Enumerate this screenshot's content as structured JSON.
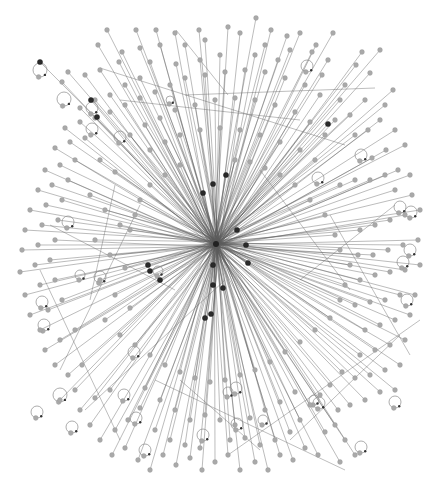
{
  "graph": {
    "type": "network",
    "layout": "radial-star",
    "width": 438,
    "height": 481,
    "colors": {
      "background": "#ffffff",
      "node": "#a9a9a9",
      "node_dark": "#2a2a2a",
      "edge": "#5a5a5a",
      "loop": "#8a8a8a"
    },
    "hub": {
      "x": 216,
      "y": 244,
      "r": 3
    },
    "node_radius": 2.4,
    "nodes": [
      [
        107,
        30
      ],
      [
        136,
        30
      ],
      [
        256,
        18
      ],
      [
        333,
        33
      ],
      [
        176,
        64
      ],
      [
        228,
        27
      ],
      [
        300,
        33
      ],
      [
        199,
        30
      ],
      [
        175,
        33
      ],
      [
        156,
        30
      ],
      [
        240,
        33
      ],
      [
        271,
        30
      ],
      [
        287,
        36
      ],
      [
        316,
        45
      ],
      [
        328,
        60
      ],
      [
        362,
        52
      ],
      [
        312,
        52
      ],
      [
        278,
        60
      ],
      [
        255,
        55
      ],
      [
        205,
        40
      ],
      [
        185,
        45
      ],
      [
        160,
        45
      ],
      [
        140,
        48
      ],
      [
        119,
        62
      ],
      [
        98,
        45
      ],
      [
        122,
        52
      ],
      [
        85,
        75
      ],
      [
        68,
        72
      ],
      [
        62,
        82
      ],
      [
        100,
        70
      ],
      [
        150,
        62
      ],
      [
        200,
        60
      ],
      [
        220,
        55
      ],
      [
        265,
        45
      ],
      [
        290,
        50
      ],
      [
        345,
        85
      ],
      [
        322,
        75
      ],
      [
        340,
        100
      ],
      [
        356,
        65
      ],
      [
        380,
        50
      ],
      [
        370,
        73
      ],
      [
        365,
        100
      ],
      [
        350,
        115
      ],
      [
        335,
        120
      ],
      [
        393,
        90
      ],
      [
        385,
        105
      ],
      [
        380,
        120
      ],
      [
        368,
        130
      ],
      [
        355,
        135
      ],
      [
        395,
        130
      ],
      [
        405,
        145
      ],
      [
        386,
        150
      ],
      [
        372,
        158
      ],
      [
        410,
        175
      ],
      [
        398,
        170
      ],
      [
        385,
        175
      ],
      [
        370,
        180
      ],
      [
        355,
        180
      ],
      [
        340,
        185
      ],
      [
        395,
        190
      ],
      [
        412,
        195
      ],
      [
        420,
        210
      ],
      [
        405,
        215
      ],
      [
        390,
        220
      ],
      [
        375,
        225
      ],
      [
        360,
        230
      ],
      [
        418,
        240
      ],
      [
        403,
        245
      ],
      [
        388,
        250
      ],
      [
        373,
        255
      ],
      [
        358,
        255
      ],
      [
        420,
        265
      ],
      [
        405,
        270
      ],
      [
        390,
        272
      ],
      [
        375,
        275
      ],
      [
        360,
        280
      ],
      [
        415,
        295
      ],
      [
        400,
        295
      ],
      [
        385,
        300
      ],
      [
        370,
        302
      ],
      [
        355,
        305
      ],
      [
        410,
        315
      ],
      [
        395,
        320
      ],
      [
        380,
        325
      ],
      [
        365,
        330
      ],
      [
        405,
        340
      ],
      [
        390,
        345
      ],
      [
        375,
        350
      ],
      [
        360,
        355
      ],
      [
        400,
        365
      ],
      [
        385,
        370
      ],
      [
        370,
        375
      ],
      [
        355,
        378
      ],
      [
        395,
        390
      ],
      [
        380,
        392
      ],
      [
        365,
        400
      ],
      [
        350,
        405
      ],
      [
        342,
        372
      ],
      [
        330,
        385
      ],
      [
        320,
        395
      ],
      [
        310,
        405
      ],
      [
        300,
        420
      ],
      [
        338,
        410
      ],
      [
        335,
        425
      ],
      [
        325,
        432
      ],
      [
        345,
        440
      ],
      [
        355,
        455
      ],
      [
        340,
        462
      ],
      [
        318,
        455
      ],
      [
        305,
        448
      ],
      [
        293,
        460
      ],
      [
        280,
        455
      ],
      [
        268,
        470
      ],
      [
        255,
        462
      ],
      [
        240,
        470
      ],
      [
        228,
        455
      ],
      [
        215,
        462
      ],
      [
        202,
        470
      ],
      [
        190,
        458
      ],
      [
        176,
        465
      ],
      [
        163,
        455
      ],
      [
        150,
        470
      ],
      [
        138,
        460
      ],
      [
        125,
        448
      ],
      [
        112,
        455
      ],
      [
        100,
        440
      ],
      [
        115,
        430
      ],
      [
        128,
        420
      ],
      [
        140,
        408
      ],
      [
        90,
        425
      ],
      [
        80,
        410
      ],
      [
        95,
        398
      ],
      [
        110,
        390
      ],
      [
        75,
        390
      ],
      [
        60,
        400
      ],
      [
        68,
        375
      ],
      [
        82,
        365
      ],
      [
        55,
        365
      ],
      [
        45,
        350
      ],
      [
        60,
        340
      ],
      [
        75,
        330
      ],
      [
        40,
        330
      ],
      [
        30,
        315
      ],
      [
        48,
        310
      ],
      [
        62,
        300
      ],
      [
        25,
        295
      ],
      [
        40,
        285
      ],
      [
        55,
        280
      ],
      [
        20,
        272
      ],
      [
        35,
        265
      ],
      [
        50,
        260
      ],
      [
        22,
        250
      ],
      [
        38,
        245
      ],
      [
        55,
        240
      ],
      [
        25,
        230
      ],
      [
        42,
        225
      ],
      [
        58,
        220
      ],
      [
        30,
        210
      ],
      [
        46,
        205
      ],
      [
        62,
        200
      ],
      [
        38,
        190
      ],
      [
        52,
        185
      ],
      [
        68,
        180
      ],
      [
        45,
        170
      ],
      [
        60,
        165
      ],
      [
        75,
        160
      ],
      [
        55,
        148
      ],
      [
        70,
        142
      ],
      [
        85,
        138
      ],
      [
        65,
        128
      ],
      [
        80,
        122
      ],
      [
        95,
        118
      ],
      [
        80,
        108
      ],
      [
        95,
        100
      ],
      [
        110,
        95
      ],
      [
        125,
        85
      ],
      [
        140,
        78
      ],
      [
        110,
        112
      ],
      [
        125,
        105
      ],
      [
        140,
        98
      ],
      [
        155,
        92
      ],
      [
        170,
        85
      ],
      [
        185,
        78
      ],
      [
        205,
        75
      ],
      [
        225,
        72
      ],
      [
        245,
        70
      ],
      [
        265,
        72
      ],
      [
        285,
        78
      ],
      [
        305,
        85
      ],
      [
        320,
        95
      ],
      [
        130,
        135
      ],
      [
        145,
        125
      ],
      [
        160,
        118
      ],
      [
        175,
        110
      ],
      [
        195,
        105
      ],
      [
        215,
        100
      ],
      [
        235,
        98
      ],
      [
        255,
        100
      ],
      [
        275,
        105
      ],
      [
        295,
        112
      ],
      [
        310,
        122
      ],
      [
        325,
        135
      ],
      [
        150,
        150
      ],
      [
        165,
        142
      ],
      [
        180,
        135
      ],
      [
        200,
        130
      ],
      [
        220,
        128
      ],
      [
        240,
        130
      ],
      [
        260,
        135
      ],
      [
        280,
        142
      ],
      [
        300,
        150
      ],
      [
        315,
        160
      ],
      [
        100,
        160
      ],
      [
        115,
        172
      ],
      [
        90,
        195
      ],
      [
        105,
        210
      ],
      [
        120,
        225
      ],
      [
        95,
        240
      ],
      [
        110,
        255
      ],
      [
        125,
        268
      ],
      [
        100,
        280
      ],
      [
        115,
        295
      ],
      [
        130,
        308
      ],
      [
        105,
        320
      ],
      [
        120,
        335
      ],
      [
        135,
        345
      ],
      [
        150,
        355
      ],
      [
        165,
        365
      ],
      [
        180,
        372
      ],
      [
        195,
        378
      ],
      [
        210,
        382
      ],
      [
        225,
        380
      ],
      [
        240,
        375
      ],
      [
        255,
        370
      ],
      [
        270,
        362
      ],
      [
        285,
        352
      ],
      [
        300,
        342
      ],
      [
        315,
        330
      ],
      [
        330,
        318
      ],
      [
        340,
        300
      ],
      [
        345,
        285
      ],
      [
        350,
        265
      ],
      [
        340,
        250
      ],
      [
        335,
        235
      ],
      [
        325,
        215
      ],
      [
        310,
        200
      ],
      [
        295,
        185
      ],
      [
        280,
        175
      ],
      [
        265,
        168
      ],
      [
        250,
        162
      ],
      [
        235,
        160
      ],
      [
        180,
        165
      ],
      [
        165,
        175
      ],
      [
        150,
        185
      ],
      [
        140,
        200
      ],
      [
        135,
        215
      ],
      [
        130,
        230
      ],
      [
        160,
        400
      ],
      [
        175,
        410
      ],
      [
        190,
        420
      ],
      [
        205,
        415
      ],
      [
        220,
        420
      ],
      [
        235,
        425
      ],
      [
        250,
        418
      ],
      [
        265,
        410
      ],
      [
        280,
        402
      ],
      [
        295,
        392
      ],
      [
        145,
        388
      ],
      [
        170,
        440
      ],
      [
        185,
        445
      ],
      [
        200,
        448
      ],
      [
        230,
        440
      ],
      [
        245,
        438
      ],
      [
        260,
        445
      ],
      [
        275,
        440
      ],
      [
        290,
        432
      ],
      [
        155,
        430
      ]
    ],
    "dark_nodes": [
      [
        40,
        62
      ],
      [
        91,
        100
      ],
      [
        328,
        124
      ],
      [
        213,
        184
      ],
      [
        226,
        175
      ],
      [
        203,
        193
      ],
      [
        237,
        230
      ],
      [
        246,
        245
      ],
      [
        248,
        263
      ],
      [
        213,
        265
      ],
      [
        213,
        285
      ],
      [
        223,
        288
      ],
      [
        148,
        265
      ],
      [
        150,
        271
      ],
      [
        205,
        318
      ],
      [
        211,
        314
      ],
      [
        97,
        117
      ],
      [
        160,
        280
      ]
    ],
    "self_loops": [
      {
        "cx": 40,
        "cy": 70,
        "r": 7
      },
      {
        "cx": 64,
        "cy": 99,
        "r": 7
      },
      {
        "cx": 92,
        "cy": 108,
        "r": 6
      },
      {
        "cx": 92,
        "cy": 129,
        "r": 6
      },
      {
        "cx": 307,
        "cy": 66,
        "r": 6
      },
      {
        "cx": 120,
        "cy": 137,
        "r": 6
      },
      {
        "cx": 68,
        "cy": 222,
        "r": 6
      },
      {
        "cx": 100,
        "cy": 277,
        "r": 6
      },
      {
        "cx": 42,
        "cy": 302,
        "r": 6
      },
      {
        "cx": 44,
        "cy": 325,
        "r": 6
      },
      {
        "cx": 80,
        "cy": 275,
        "r": 5
      },
      {
        "cx": 134,
        "cy": 352,
        "r": 6
      },
      {
        "cx": 60,
        "cy": 395,
        "r": 7
      },
      {
        "cx": 37,
        "cy": 412,
        "r": 6
      },
      {
        "cx": 72,
        "cy": 427,
        "r": 6
      },
      {
        "cx": 124,
        "cy": 395,
        "r": 6
      },
      {
        "cx": 136,
        "cy": 418,
        "r": 6
      },
      {
        "cx": 145,
        "cy": 450,
        "r": 6
      },
      {
        "cx": 203,
        "cy": 435,
        "r": 6
      },
      {
        "cx": 236,
        "cy": 388,
        "r": 6
      },
      {
        "cx": 228,
        "cy": 392,
        "r": 5
      },
      {
        "cx": 237,
        "cy": 424,
        "r": 6
      },
      {
        "cx": 263,
        "cy": 420,
        "r": 5
      },
      {
        "cx": 314,
        "cy": 400,
        "r": 5
      },
      {
        "cx": 319,
        "cy": 403,
        "r": 6
      },
      {
        "cx": 395,
        "cy": 402,
        "r": 6
      },
      {
        "cx": 361,
        "cy": 447,
        "r": 6
      },
      {
        "cx": 361,
        "cy": 155,
        "r": 6
      },
      {
        "cx": 318,
        "cy": 178,
        "r": 6
      },
      {
        "cx": 400,
        "cy": 207,
        "r": 6
      },
      {
        "cx": 411,
        "cy": 212,
        "r": 6
      },
      {
        "cx": 410,
        "cy": 250,
        "r": 6
      },
      {
        "cx": 403,
        "cy": 262,
        "r": 6
      },
      {
        "cx": 407,
        "cy": 300,
        "r": 6
      },
      {
        "cx": 158,
        "cy": 271,
        "r": 5
      },
      {
        "cx": 170,
        "cy": 100,
        "r": 4
      }
    ],
    "cross_edges": [
      [
        [
          100,
          68
        ],
        [
          345,
          145
        ]
      ],
      [
        [
          176,
          30
        ],
        [
          228,
          95
        ]
      ],
      [
        [
          120,
          100
        ],
        [
          300,
          120
        ]
      ],
      [
        [
          185,
          95
        ],
        [
          375,
          88
        ]
      ],
      [
        [
          60,
          370
        ],
        [
          140,
          205
        ]
      ],
      [
        [
          85,
          410
        ],
        [
          225,
          280
        ]
      ],
      [
        [
          155,
          380
        ],
        [
          345,
          470
        ]
      ],
      [
        [
          228,
          455
        ],
        [
          420,
          320
        ]
      ],
      [
        [
          290,
          440
        ],
        [
          400,
          335
        ]
      ],
      [
        [
          330,
          215
        ],
        [
          410,
          355
        ]
      ],
      [
        [
          260,
          170
        ],
        [
          350,
          290
        ]
      ],
      [
        [
          40,
          270
        ],
        [
          120,
          440
        ]
      ],
      [
        [
          90,
          300
        ],
        [
          115,
          185
        ]
      ],
      [
        [
          180,
          380
        ],
        [
          260,
          450
        ]
      ],
      [
        [
          300,
          280
        ],
        [
          395,
          205
        ]
      ],
      [
        [
          50,
          225
        ],
        [
          175,
          290
        ]
      ]
    ]
  }
}
